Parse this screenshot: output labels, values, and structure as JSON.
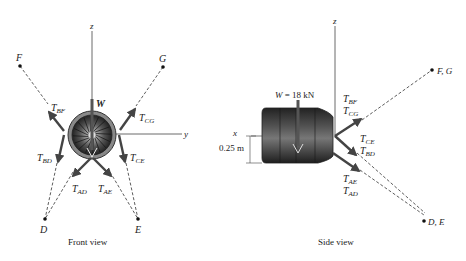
{
  "front_view": {
    "caption": "Front view",
    "axes": {
      "z": "z",
      "y": "y"
    },
    "points": {
      "F": "F",
      "G": "G",
      "D": "D",
      "E": "E"
    },
    "weight_label": "W",
    "forces": [
      {
        "main": "T",
        "sub": "BF"
      },
      {
        "main": "T",
        "sub": "CG"
      },
      {
        "main": "T",
        "sub": "BD"
      },
      {
        "main": "T",
        "sub": "CE"
      },
      {
        "main": "T",
        "sub": "AD"
      },
      {
        "main": "T",
        "sub": "AE"
      }
    ]
  },
  "side_view": {
    "caption": "Side view",
    "axes": {
      "z": "z",
      "x": "x"
    },
    "points": {
      "FG": "F, G",
      "DE": "D, E"
    },
    "weight": {
      "symbol": "W",
      "value": " = 18 kN"
    },
    "dimension": "0.25 m",
    "forces": [
      {
        "main": "T",
        "sub": "BF"
      },
      {
        "main": "T",
        "sub": "CG"
      },
      {
        "main": "T",
        "sub": "CE"
      },
      {
        "main": "T",
        "sub": "BD"
      },
      {
        "main": "T",
        "sub": "AE"
      },
      {
        "main": "T",
        "sub": "AD"
      }
    ]
  },
  "colors": {
    "arrow": "#444444",
    "line": "#333333",
    "engine_dark": "#2a2a2a",
    "engine_mid": "#777777"
  }
}
